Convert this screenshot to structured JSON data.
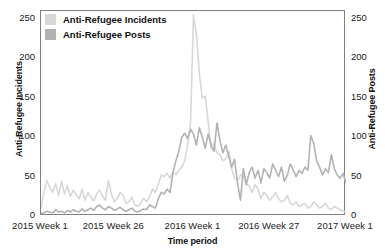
{
  "chart_data": {
    "type": "line",
    "title": "",
    "xlabel": "Time period",
    "ylabel": "Anti-Refugee Incidents",
    "ylabel_right": "Anti-Refugee Posts",
    "ylim": [
      0,
      260
    ],
    "ylim_right": [
      0,
      260
    ],
    "yticks": [
      0,
      50,
      100,
      150,
      200,
      250
    ],
    "yticks_right": [
      0,
      50,
      100,
      150,
      200,
      250
    ],
    "xticks": [
      "2015 Week 1",
      "2015 Week 26",
      "2016 Week 1",
      "2016 Week 27",
      "2017 Week 1"
    ],
    "xtick_positions": [
      0,
      25,
      52,
      78,
      104
    ],
    "grid": false,
    "legend_position": "top-left",
    "x_count": 105,
    "series": [
      {
        "name": "Anti-Refugee Incidents",
        "axis": "left",
        "color": "#d8d8d8",
        "values": [
          10,
          30,
          45,
          36,
          30,
          41,
          26,
          44,
          28,
          38,
          25,
          33,
          27,
          22,
          34,
          20,
          30,
          24,
          19,
          28,
          33,
          25,
          20,
          45,
          28,
          18,
          22,
          30,
          26,
          16,
          18,
          24,
          14,
          12,
          16,
          22,
          18,
          24,
          34,
          30,
          40,
          52,
          50,
          54,
          48,
          56,
          52,
          58,
          62,
          70,
          90,
          120,
          255,
          230,
          180,
          150,
          152,
          120,
          86,
          92,
          80,
          78,
          70,
          72,
          82,
          60,
          48,
          45,
          52,
          50,
          40,
          38,
          30,
          40,
          34,
          22,
          30,
          26,
          20,
          24,
          30,
          22,
          18,
          20,
          26,
          16,
          14,
          18,
          12,
          14,
          16,
          10,
          12,
          18,
          14,
          10,
          12,
          16,
          10,
          8,
          12,
          10,
          8,
          6,
          5
        ]
      },
      {
        "name": "Anti-Refugee Posts",
        "axis": "right",
        "color": "#b2b2b2",
        "values": [
          3,
          4,
          6,
          5,
          4,
          8,
          5,
          6,
          4,
          7,
          5,
          8,
          6,
          5,
          9,
          6,
          8,
          10,
          7,
          12,
          14,
          10,
          8,
          12,
          10,
          7,
          9,
          11,
          8,
          6,
          8,
          10,
          6,
          5,
          7,
          9,
          8,
          14,
          12,
          10,
          22,
          30,
          28,
          34,
          30,
          55,
          70,
          82,
          100,
          105,
          98,
          110,
          104,
          90,
          112,
          100,
          86,
          104,
          90,
          82,
          118,
          96,
          80,
          90,
          76,
          62,
          72,
          42,
          20,
          60,
          40,
          55,
          62,
          48,
          58,
          42,
          60,
          55,
          48,
          66,
          58,
          50,
          62,
          44,
          52,
          66,
          58,
          50,
          58,
          54,
          62,
          58,
          102,
          92,
          70,
          62,
          52,
          60,
          55,
          78,
          60,
          52,
          48,
          54,
          42
        ]
      }
    ]
  },
  "legend": {
    "items": [
      {
        "label": "Anti-Refugee Incidents",
        "color": "#d8d8d8"
      },
      {
        "label": "Anti-Refugee Posts",
        "color": "#b2b2b2"
      }
    ]
  }
}
